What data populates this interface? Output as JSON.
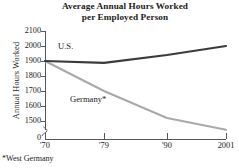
{
  "chart_data": {
    "type": "line",
    "title": "Average Annual Hours Worked per Employed Person",
    "title_lines": [
      "Average Annual Hours Worked",
      "per Employed Person"
    ],
    "xlabel": "",
    "ylabel": "Annual Hours Worked",
    "x": [
      "'70",
      "'79",
      "'90",
      "2001"
    ],
    "x_numeric": [
      1970,
      1979,
      1990,
      2001
    ],
    "xtick_labels": [
      "'70",
      "'79",
      "'90",
      "2001"
    ],
    "ytick_labels": [
      "2100",
      "2000",
      "1900",
      "1800",
      "1700",
      "1600",
      "1500"
    ],
    "ytick_values": [
      2100,
      2000,
      1900,
      1800,
      1700,
      1600,
      1500
    ],
    "ylim": [
      1500,
      2100
    ],
    "y_axis_break": true,
    "y_axis_origin_label": "0",
    "grid": false,
    "legend_position": "inline",
    "series": [
      {
        "name": "U.S.",
        "label": "U.S.",
        "color": "#3b3b3d",
        "values": [
          1900,
          1888,
          1940,
          2000
        ]
      },
      {
        "name": "Germany*",
        "label": "Germany*",
        "color": "#a9a9ab",
        "values": [
          1900,
          1700,
          1520,
          1442
        ]
      }
    ],
    "annotations": [
      {
        "text": "*West Germany",
        "kind": "footnote"
      }
    ]
  },
  "footnote": "*West Germany",
  "colors": {
    "axis": "#55565a",
    "us_line": "#3b3b3d",
    "germany_line": "#a9a9ab",
    "text": "#1a1a1a",
    "background": "#ffffff"
  }
}
